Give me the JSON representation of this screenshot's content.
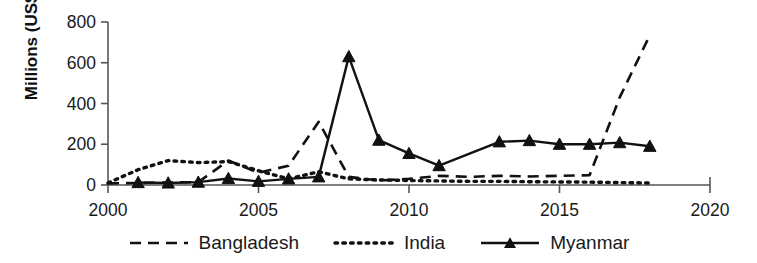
{
  "chart_data": {
    "type": "line",
    "title": "",
    "subtitle": "",
    "xlabel": "",
    "ylabel": "Millions (US$)",
    "xlim": [
      2000,
      2020
    ],
    "ylim": [
      0,
      800
    ],
    "xticks": [
      2000,
      2005,
      2010,
      2015,
      2020
    ],
    "yticks": [
      0,
      200,
      400,
      600,
      800
    ],
    "xtick_labels": [
      "2000",
      "2005",
      "2010",
      "2015",
      "2020"
    ],
    "ytick_labels": [
      "0",
      "200",
      "400",
      "600",
      "800"
    ],
    "grid": false,
    "legend_position": "bottom",
    "series": [
      {
        "name": "Bangladesh",
        "style": "dashed",
        "marker": "none",
        "color": "#111111",
        "x": [
          2000,
          2001,
          2002,
          2003,
          2004,
          2005,
          2006,
          2007,
          2008,
          2009,
          2010,
          2011,
          2012,
          2013,
          2014,
          2015,
          2016,
          2017,
          2018
        ],
        "values": [
          8,
          10,
          12,
          14,
          120,
          60,
          95,
          310,
          40,
          22,
          30,
          45,
          40,
          45,
          42,
          45,
          48,
          430,
          735
        ]
      },
      {
        "name": "India",
        "style": "dotted",
        "marker": "none",
        "color": "#111111",
        "x": [
          2000,
          2001,
          2002,
          2003,
          2004,
          2005,
          2006,
          2007,
          2008,
          2009,
          2010,
          2011,
          2012,
          2013,
          2014,
          2015,
          2016,
          2017,
          2018
        ],
        "values": [
          10,
          75,
          120,
          110,
          115,
          70,
          30,
          65,
          30,
          25,
          22,
          20,
          18,
          18,
          16,
          15,
          14,
          12,
          10
        ]
      },
      {
        "name": "Myanmar",
        "style": "solid",
        "marker": "triangle",
        "color": "#111111",
        "x": [
          2001,
          2002,
          2003,
          2004,
          2005,
          2006,
          2007,
          2008,
          2009,
          2010,
          2011,
          2013,
          2014,
          2015,
          2016,
          2017,
          2018
        ],
        "values": [
          12,
          10,
          14,
          32,
          18,
          30,
          40,
          630,
          220,
          155,
          95,
          212,
          218,
          200,
          200,
          208,
          190
        ]
      }
    ]
  },
  "axes": {
    "y_axis_title": "Millions (US$)"
  },
  "legend": {
    "items": [
      {
        "label": "Bangladesh",
        "swatch": "dashed-line-swatch"
      },
      {
        "label": "India",
        "swatch": "dotted-line-swatch"
      },
      {
        "label": "Myanmar",
        "swatch": "solid-line-triangle-swatch"
      }
    ]
  }
}
